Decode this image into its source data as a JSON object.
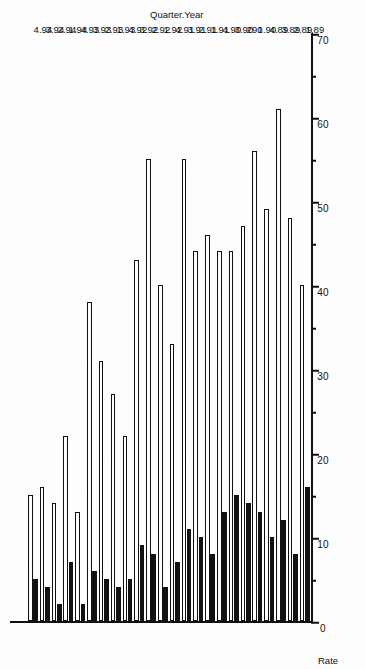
{
  "figure": {
    "orientation": "rotated-90-ccw",
    "background_color": "#fefefe",
    "ink_color": "#111111"
  },
  "axis_titles": {
    "value_axis": "Rate",
    "category_axis": "Quarter.Year"
  },
  "chart_data": {
    "type": "bar",
    "title": "",
    "subtitle": "",
    "xlabel": "Quarter.Year",
    "ylabel": "Rate",
    "orientation": "horizontal-rotated",
    "grid": false,
    "legend_position": "none",
    "ylim": [
      0,
      70
    ],
    "ytick_values": [
      0,
      10,
      20,
      30,
      40,
      50,
      60,
      70
    ],
    "ytick_labels": [
      "0",
      "10",
      "20",
      "30",
      "40",
      "50",
      "60",
      "70"
    ],
    "minor_tick_interval": 5,
    "categories": [
      "1.89",
      "2.89",
      "3.89",
      "4.89",
      "1.90",
      "290",
      "3.90",
      "4.90",
      "1.91",
      "2.91",
      "3.91",
      "4.91",
      "1.92",
      "2.92",
      "3.92",
      "4.92",
      "1.93",
      "2.93",
      "3.93",
      "4.93",
      "1.94",
      "2.94",
      "3.94",
      "4.94"
    ],
    "series": [
      {
        "name": "open",
        "style": "white-filled-black-outline",
        "fill": "#fefefe",
        "edge": "#111111",
        "values": [
          40,
          48,
          61,
          49,
          56,
          47,
          44,
          44,
          46,
          44,
          55,
          33,
          40,
          55,
          43,
          22,
          27,
          31,
          38,
          13,
          22,
          14,
          16,
          15
        ]
      },
      {
        "name": "solid",
        "style": "solid-black",
        "fill": "#111111",
        "edge": "#111111",
        "values": [
          16,
          8,
          12,
          10,
          13,
          14,
          15,
          13,
          8,
          10,
          11,
          7,
          4,
          8,
          9,
          5,
          4,
          5,
          6,
          2,
          7,
          2,
          4,
          5
        ]
      }
    ]
  }
}
